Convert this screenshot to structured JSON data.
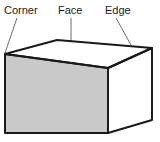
{
  "diagram": {
    "background_color": "#ffffff",
    "labels": [
      {
        "id": "corner",
        "text": "Corner",
        "x": 4,
        "y": 14,
        "anchor": "start"
      },
      {
        "id": "face",
        "text": "Face",
        "x": 58,
        "y": 14,
        "anchor": "start"
      },
      {
        "id": "edge",
        "text": "Edge",
        "x": 105,
        "y": 14,
        "anchor": "start"
      }
    ],
    "leader_lines": [
      {
        "id": "corner-leader",
        "x1": 17,
        "y1": 18,
        "x2": 5,
        "y2": 53
      },
      {
        "id": "face-leader",
        "x1": 71,
        "y1": 18,
        "x2": 71,
        "y2": 85
      },
      {
        "id": "edge-leader",
        "x1": 116,
        "y1": 18,
        "x2": 131,
        "y2": 45
      }
    ],
    "leader_color": "#6b6b6b",
    "leader_width": 1,
    "shape": {
      "name": "cuboid",
      "outline_color": "#1a1a1a",
      "outline_width": 2,
      "vertices": {
        "front_top_left": [
          5,
          54
        ],
        "front_top_right": [
          108,
          68
        ],
        "front_bottom_right": [
          108,
          133
        ],
        "front_bottom_left": [
          5,
          133
        ],
        "back_top_left": [
          57,
          40
        ],
        "back_top_right": [
          152,
          48
        ],
        "back_bottom_right": [
          152,
          120
        ]
      },
      "faces": [
        {
          "id": "front-face",
          "fill": "#c9c9c9",
          "points": "5,54 108,68 108,133 5,133"
        },
        {
          "id": "top-face",
          "fill": "#ffffff",
          "points": "5,54 57,40 152,48 108,68"
        },
        {
          "id": "right-face",
          "fill": "#ffffff",
          "points": "108,68 152,48 152,120 108,133"
        }
      ]
    }
  }
}
